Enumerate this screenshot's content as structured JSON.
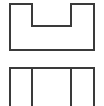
{
  "figure": {
    "background_color": "#ffffff",
    "stroke_color": "#3a3a3a",
    "stroke_width": 2,
    "width": 104,
    "height": 106
  },
  "views": [
    {
      "name": "front-view",
      "label": "Front view — U-shaped notched block outline",
      "shape_type": "notched-rectangle",
      "bounds": {
        "x": 10,
        "y": 4,
        "width": 84,
        "height": 46
      },
      "notch": {
        "x": 32,
        "y": 4,
        "width": 39,
        "height": 22
      },
      "path": "M 10 4 L 32 4 L 32 26 L 71 26 L 71 4 L 94 4 L 94 50 L 10 50 Z",
      "vertices": [
        [
          10,
          4
        ],
        [
          32,
          4
        ],
        [
          32,
          26
        ],
        [
          71,
          26
        ],
        [
          71,
          4
        ],
        [
          94,
          4
        ],
        [
          94,
          50
        ],
        [
          10,
          50
        ]
      ]
    },
    {
      "name": "top-view",
      "label": "Top view — rectangle with two internal division lines, cropped at bottom",
      "shape_type": "divided-rectangle",
      "bounds": {
        "x": 10,
        "y": 68,
        "width": 84,
        "height": 38
      },
      "cropped_bottom": true,
      "outline_path": "M 10 106 L 10 68 L 94 68 L 94 106",
      "interior_lines": [
        {
          "name": "division-line-left",
          "x": 32,
          "y1": 68,
          "y2": 106
        },
        {
          "name": "division-line-right",
          "x": 71,
          "y1": 68,
          "y2": 106
        }
      ]
    }
  ]
}
